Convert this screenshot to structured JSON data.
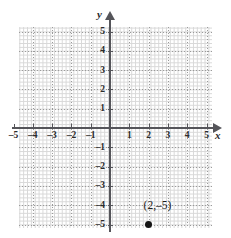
{
  "figure": {
    "type": "coordinate-plane",
    "background_color": "#ffffff",
    "grid_color": "#9a9a9a",
    "minor_grid_color": "#d8d8d8",
    "axis_color": "#55555a",
    "point_color": "#141414"
  },
  "axes": {
    "x_name": "x",
    "y_name": "y",
    "x_ticks": [
      "–5",
      "–4",
      "–3",
      "–2",
      "–1",
      "1",
      "2",
      "3",
      "4",
      "5"
    ],
    "y_ticks": [
      "5",
      "4",
      "3",
      "2",
      "1",
      "–1",
      "–2",
      "–3",
      "–4",
      "–5"
    ]
  },
  "chart_data": {
    "type": "scatter",
    "title": "",
    "xlabel": "x",
    "ylabel": "y",
    "xlim": [
      -5.75,
      5.5
    ],
    "ylim": [
      -5.75,
      5.75
    ],
    "xticks": [
      -5,
      -4,
      -3,
      -2,
      -1,
      1,
      2,
      3,
      4,
      5
    ],
    "yticks": [
      5,
      4,
      3,
      2,
      1,
      -1,
      -2,
      -3,
      -4,
      -5
    ],
    "xtick_labels": [
      "–5",
      "–4",
      "–3",
      "–2",
      "–1",
      "1",
      "2",
      "3",
      "4",
      "5"
    ],
    "ytick_labels": [
      "5",
      "4",
      "3",
      "2",
      "1",
      "–1",
      "–2",
      "–3",
      "–4",
      "–5"
    ],
    "grid": true,
    "minor_grid": true,
    "legend": null,
    "points": [
      {
        "x": 2,
        "y": -5,
        "label": "(2,–5)"
      }
    ]
  }
}
